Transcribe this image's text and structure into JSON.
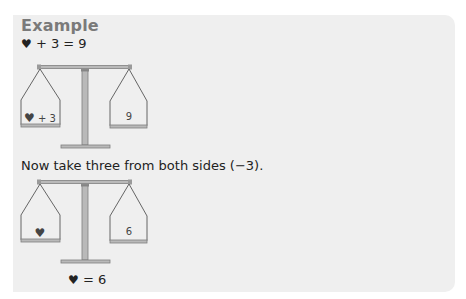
{
  "example": {
    "title": "Example",
    "equation_heart": "♥",
    "equation_rest": " + 3 = 9",
    "scale1": {
      "left_pan_heart": "♥",
      "left_pan_rest": " + 3",
      "right_pan": "9"
    },
    "instruction": "Now take three from both sides (−3).",
    "scale2": {
      "left_pan_heart": "♥",
      "left_pan_rest": "",
      "right_pan": "6"
    },
    "result_heart": "♥",
    "result_rest": " = 6"
  },
  "colors": {
    "box_background": "#efefef",
    "title": "#7a7a7a",
    "scale_fill": "#b9b9b9",
    "scale_outline": "#7f7f7f"
  }
}
